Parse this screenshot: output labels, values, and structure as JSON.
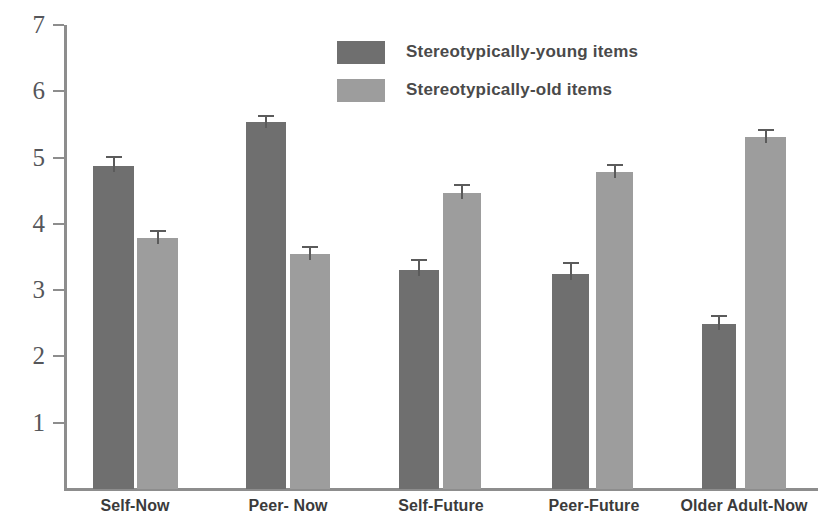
{
  "chart_data": {
    "type": "bar",
    "title": "",
    "xlabel": "",
    "ylabel": "",
    "ylim": [
      0,
      7
    ],
    "yticks": [
      1,
      2,
      3,
      4,
      5,
      6,
      7
    ],
    "grid": false,
    "legend_position": "top-center",
    "categories": [
      "Self-Now",
      "Peer- Now",
      "Self-Future",
      "Peer-Future",
      "Older Adult-Now"
    ],
    "series": [
      {
        "name": "Stereotypically-young items",
        "color": "#6f6f6f",
        "values": [
          4.88,
          5.53,
          3.3,
          3.24,
          2.49
        ],
        "errors": [
          0.15,
          0.11,
          0.17,
          0.19,
          0.13
        ]
      },
      {
        "name": "Stereotypically-old items",
        "color": "#9d9d9d",
        "values": [
          3.79,
          3.55,
          4.46,
          4.78,
          5.31
        ],
        "errors": [
          0.11,
          0.12,
          0.14,
          0.12,
          0.12
        ]
      }
    ]
  },
  "axis": {
    "tick_labels": [
      "7",
      "6",
      "5",
      "4",
      "3",
      "2",
      "1"
    ]
  },
  "legend": {
    "items": [
      {
        "label": "Stereotypically-young items",
        "color": "#6f6f6f"
      },
      {
        "label": "Stereotypically-old items",
        "color": "#9d9d9d"
      }
    ]
  }
}
